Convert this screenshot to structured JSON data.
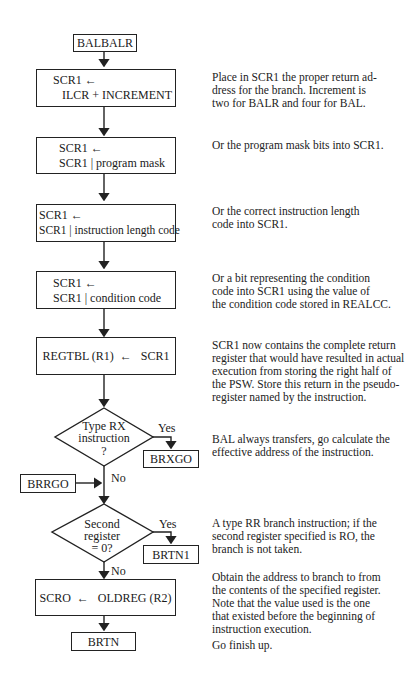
{
  "flowchart": {
    "start": {
      "label": "BALBALR"
    },
    "steps": [
      {
        "line1": "SCR1 ←",
        "line2": "ILCR + INCREMENT"
      },
      {
        "line1": "SCR1 ←",
        "line2": "SCR1 | program mask"
      },
      {
        "line1": "SCR1 ←",
        "line2": "SCR1 | instruction length code"
      },
      {
        "line1": "SCR1 ←",
        "line2": "SCR1 | condition code"
      },
      {
        "line1": "REGTBL (R1)  ←   SCR1"
      }
    ],
    "decision1": {
      "line1": "Type RX",
      "line2": "instruction",
      "line3": "?",
      "yes": "Yes",
      "no": "No",
      "yes_target": "BRXGO"
    },
    "entry": {
      "label": "BRRGO"
    },
    "decision2": {
      "line1": "Second",
      "line2": "register",
      "line3": "= 0?",
      "yes": "Yes",
      "no": "No",
      "yes_target": "BRTN1"
    },
    "step_final": {
      "line1": "SCRO  ←   OLDREG (R2)"
    },
    "end": {
      "label": "BRTN"
    }
  },
  "descriptions": [
    "Place in SCR1 the proper return ad-\ndress for the branch.  Increment is\ntwo for BALR and four for BAL.",
    "Or the program mask bits into SCR1.",
    "Or the correct instruction length\ncode into SCR1.",
    "Or a bit representing the condition\ncode into SCR1 using the value of\nthe condition code stored in REALCC.",
    "SCR1 now contains the complete return\nregister that would have resulted in actual\nexecution from storing the right half of\nthe PSW.  Store this return in the pseudo-\nregister named by the instruction.",
    "BAL always transfers, go calculate the\neffective address of the instruction.",
    "A type RR branch instruction; if the\nsecond register specified is RO, the\nbranch is not taken.",
    "Obtain the address to branch to from\nthe contents of the specified register.\nNote that the value used is the one\nthat existed before the beginning of\ninstruction execution.",
    "Go finish up."
  ]
}
